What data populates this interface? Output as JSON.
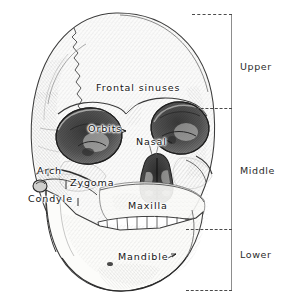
{
  "figure": {
    "style": "pen-and-ink hatched medical illustration",
    "width": 284,
    "height": 302,
    "background_color": "#ffffff",
    "ink_color": "#141414"
  },
  "annotations": [
    {
      "id": "frontal-sinuses",
      "label": "Frontal sinuses",
      "x": 96,
      "y": 88,
      "size": "sz-lg",
      "leader": false
    },
    {
      "id": "orbits",
      "label": "Orbits",
      "x": 88,
      "y": 130,
      "size": "sz-lg",
      "leader": true
    },
    {
      "id": "nasal",
      "label": "Nasal",
      "x": 136,
      "y": 142,
      "size": "sz-lg",
      "leader": true
    },
    {
      "id": "arch",
      "label": "Arch",
      "x": 37,
      "y": 172,
      "size": "sz-lg",
      "leader": true
    },
    {
      "id": "zygoma",
      "label": "Zygoma",
      "x": 70,
      "y": 183,
      "size": "sz-lg",
      "leader": true
    },
    {
      "id": "condyle",
      "label": "Condyle",
      "x": 30,
      "y": 200,
      "size": "sz-lg",
      "leader": true
    },
    {
      "id": "maxilla",
      "label": "Maxilla",
      "x": 128,
      "y": 206,
      "size": "sz-lg",
      "leader": false
    },
    {
      "id": "mandible",
      "label": "Mandible",
      "x": 120,
      "y": 257,
      "size": "sz-lg",
      "leader": true
    }
  ],
  "bracket": {
    "spine_color": "#8d8d8d",
    "tick_color": "#4a4a4a",
    "ticks_y": [
      14,
      108,
      229,
      290
    ],
    "zones": [
      {
        "id": "upper",
        "label": "Upper",
        "label_y": 66,
        "range_y": [
          14,
          108
        ]
      },
      {
        "id": "middle",
        "label": "Middle",
        "label_y": 170,
        "range_y": [
          108,
          229
        ]
      },
      {
        "id": "lower",
        "label": "Lower",
        "label_y": 254,
        "range_y": [
          229,
          290
        ]
      }
    ]
  },
  "caption": {
    "text": ""
  }
}
